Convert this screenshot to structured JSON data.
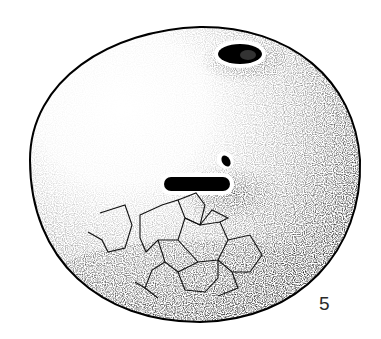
{
  "figure": {
    "label": "5",
    "colors": {
      "ink": "#000000",
      "paper": "#ffffff",
      "label": "#2a2a2a"
    }
  }
}
